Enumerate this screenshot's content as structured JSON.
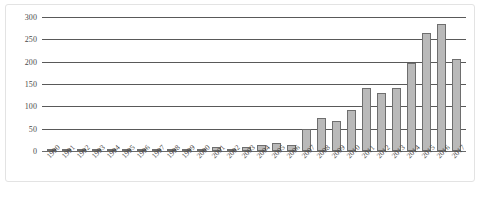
{
  "chart_data": {
    "type": "bar",
    "title": "",
    "subtitle": "",
    "xlabel": "",
    "ylabel": "",
    "ylim": [
      0,
      300
    ],
    "yticks": [
      "0",
      "50",
      "100",
      "150",
      "200",
      "250",
      "300"
    ],
    "grid": "horizontal",
    "legend": "none",
    "bar_fill_color": "#b9b9b9",
    "bar_edge_color": "#6e6e6e",
    "gridline_color": "#595959",
    "categories": [
      "1990",
      "1991",
      "1992",
      "1993",
      "1994",
      "1995",
      "1996",
      "1997",
      "1998",
      "1999",
      "2000",
      "2001",
      "2002",
      "2003",
      "2004",
      "2005",
      "2006",
      "2007",
      "2008",
      "2009",
      "2010",
      "2011",
      "2012",
      "2013",
      "2014",
      "2015",
      "2016",
      "2017"
    ],
    "values": [
      2,
      2,
      2,
      2,
      2,
      3,
      2,
      3,
      2,
      2,
      3,
      8,
      5,
      10,
      14,
      17,
      14,
      49,
      74,
      67,
      92,
      141,
      131,
      140,
      197,
      265,
      285,
      207
    ]
  },
  "caption": {
    "text": ""
  }
}
